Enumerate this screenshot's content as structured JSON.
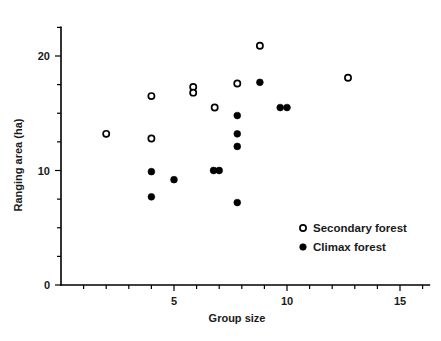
{
  "chart_data": {
    "type": "scatter",
    "title": "",
    "xlabel": "Group size",
    "ylabel": "Ranging area (ha)",
    "xlim": [
      0,
      16.3
    ],
    "ylim": [
      0,
      22.5
    ],
    "xticks": [
      1,
      2,
      3,
      4,
      5,
      6,
      7,
      8,
      9,
      10,
      11,
      12,
      13,
      14,
      15,
      16
    ],
    "xticklabels": {
      "5": "5",
      "10": "10",
      "15": "15"
    },
    "yticks": [
      0,
      2.5,
      5,
      7.5,
      10,
      12.5,
      15,
      17.5,
      20,
      22.5
    ],
    "yticklabels": {
      "0": "0",
      "10": "10",
      "20": "20"
    },
    "grid": false,
    "legend_position": "lower right",
    "series": [
      {
        "name": "Secondary forest",
        "marker": "open-circle",
        "color": "#000000",
        "points": [
          {
            "x": 2.0,
            "y": 13.2
          },
          {
            "x": 4.0,
            "y": 16.5
          },
          {
            "x": 4.0,
            "y": 12.8
          },
          {
            "x": 5.85,
            "y": 17.3
          },
          {
            "x": 5.85,
            "y": 16.8
          },
          {
            "x": 6.8,
            "y": 15.5
          },
          {
            "x": 7.8,
            "y": 17.6
          },
          {
            "x": 8.8,
            "y": 20.9
          },
          {
            "x": 12.7,
            "y": 18.1
          }
        ]
      },
      {
        "name": "Climax forest",
        "marker": "filled-circle",
        "color": "#000000",
        "points": [
          {
            "x": 4.0,
            "y": 9.9
          },
          {
            "x": 4.0,
            "y": 7.7
          },
          {
            "x": 5.0,
            "y": 9.2
          },
          {
            "x": 6.75,
            "y": 10.0
          },
          {
            "x": 7.0,
            "y": 10.0
          },
          {
            "x": 7.8,
            "y": 14.8
          },
          {
            "x": 7.8,
            "y": 13.2
          },
          {
            "x": 7.8,
            "y": 12.1
          },
          {
            "x": 7.8,
            "y": 7.2
          },
          {
            "x": 8.8,
            "y": 17.7
          },
          {
            "x": 9.7,
            "y": 15.5
          },
          {
            "x": 10.0,
            "y": 15.5
          }
        ]
      }
    ]
  },
  "legend": {
    "entries": [
      {
        "label": "Secondary forest",
        "marker": "open-circle"
      },
      {
        "label": "Climax forest",
        "marker": "filled-circle"
      }
    ]
  },
  "axes": {
    "x_label": "Group size",
    "y_label": "Ranging area (ha)",
    "x_tick_labels": [
      "5",
      "10",
      "15"
    ],
    "y_tick_labels": [
      "0",
      "10",
      "20"
    ]
  }
}
